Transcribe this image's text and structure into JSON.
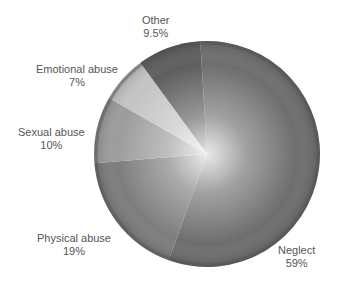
{
  "chart_data": {
    "type": "pie",
    "title": "",
    "start_angle_deg": -3.4,
    "direction": "clockwise",
    "slices": [
      {
        "label": "Neglect",
        "value": 59,
        "display": "59%",
        "color": "#6e6e6e"
      },
      {
        "label": "Physical abuse",
        "value": 19,
        "display": "19%",
        "color": "#7d7d7d"
      },
      {
        "label": "Sexual abuse",
        "value": 10,
        "display": "10%",
        "color": "#9c9c9c"
      },
      {
        "label": "Emotional abuse",
        "value": 7,
        "display": "7%",
        "color": "#c4c4c4"
      },
      {
        "label": "Other",
        "value": 9.5,
        "display": "9.5%",
        "color": "#5e5e5e"
      }
    ],
    "center": [
      207,
      154
    ],
    "radius": 113
  },
  "labels": [
    {
      "name": "Neglect",
      "pct": "59%",
      "x": 305,
      "y": 244
    },
    {
      "name": "Physical abuse",
      "pct": "19%",
      "x": 70,
      "y": 232
    },
    {
      "name": "Sexual abuse",
      "pct": "10%",
      "x": 46,
      "y": 126
    },
    {
      "name": "Emotional abuse",
      "pct": "7%",
      "x": 76,
      "y": 63
    },
    {
      "name": "Other",
      "pct": "9.5%",
      "x": 157,
      "y": 14
    }
  ]
}
